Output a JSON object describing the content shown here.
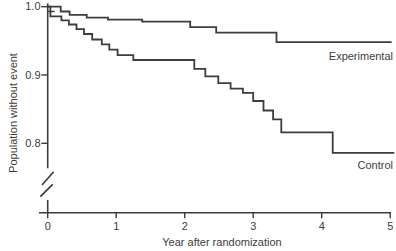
{
  "chart_data": {
    "type": "line",
    "subtype": "kaplan-meier-step",
    "title": "",
    "xlabel": "Year after randomization",
    "ylabel": "Population without event",
    "xlim": [
      0,
      5
    ],
    "ylim_shown": [
      0.8,
      1.0
    ],
    "y_axis_break": true,
    "grid": false,
    "legend_position": "curve-end-labels",
    "x_ticks": [
      0,
      1,
      2,
      3,
      4,
      5
    ],
    "y_ticks": [
      {
        "label": "1.0",
        "value": 1.0
      },
      {
        "label": "0.9",
        "value": 0.9
      },
      {
        "label": "0.8",
        "value": 0.8
      }
    ],
    "line_color": "#3d3d3d",
    "text_color": "#3d3d3d",
    "background_color": "#ffffff",
    "series": [
      {
        "name": "Experimental",
        "points": [
          [
            0,
            1.0
          ],
          [
            0.19,
            0.993
          ],
          [
            0.32,
            0.988
          ],
          [
            0.57,
            0.984
          ],
          [
            0.88,
            0.981
          ],
          [
            1.38,
            0.978
          ],
          [
            2.08,
            0.97
          ],
          [
            2.46,
            0.962
          ],
          [
            3.34,
            0.948
          ]
        ],
        "end_x": 5.02
      },
      {
        "name": "Control",
        "points": [
          [
            0,
            1.0
          ],
          [
            0.04,
            0.986
          ],
          [
            0.2,
            0.98
          ],
          [
            0.31,
            0.974
          ],
          [
            0.42,
            0.967
          ],
          [
            0.53,
            0.96
          ],
          [
            0.65,
            0.952
          ],
          [
            0.79,
            0.945
          ],
          [
            0.9,
            0.937
          ],
          [
            1.02,
            0.929
          ],
          [
            1.25,
            0.922
          ],
          [
            2.14,
            0.909
          ],
          [
            2.3,
            0.898
          ],
          [
            2.49,
            0.888
          ],
          [
            2.67,
            0.88
          ],
          [
            2.85,
            0.874
          ],
          [
            3.0,
            0.862
          ],
          [
            3.15,
            0.848
          ],
          [
            3.29,
            0.835
          ],
          [
            3.41,
            0.816
          ],
          [
            4.16,
            0.786
          ]
        ],
        "end_x": 5.06,
        "censor_mark": [
          0.05,
          0.993
        ]
      }
    ]
  }
}
